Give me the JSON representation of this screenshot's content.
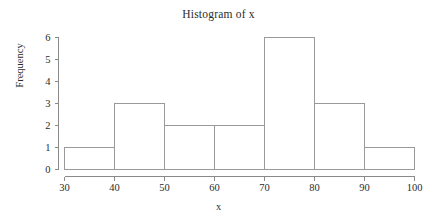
{
  "chart_data": {
    "type": "bar",
    "subtype": "histogram",
    "title": "Histogram of x",
    "xlabel": "x",
    "ylabel": "Frequency",
    "bin_edges": [
      30,
      40,
      50,
      60,
      70,
      80,
      90,
      100
    ],
    "categories": [
      "30-40",
      "40-50",
      "50-60",
      "60-70",
      "70-80",
      "80-90",
      "90-100"
    ],
    "values": [
      1,
      3,
      2,
      2,
      6,
      3,
      1
    ],
    "xlim": [
      30,
      100
    ],
    "ylim": [
      0,
      6
    ],
    "xticks": [
      30,
      40,
      50,
      60,
      70,
      80,
      90,
      100
    ],
    "yticks": [
      0,
      1,
      2,
      3,
      4,
      5,
      6
    ],
    "xtick_labels": [
      "30",
      "40",
      "50",
      "60",
      "70",
      "80",
      "90",
      "100"
    ],
    "ytick_labels": [
      "0",
      "1",
      "2",
      "3",
      "4",
      "5",
      "6"
    ],
    "grid": false,
    "legend": null,
    "bar_fill": "#ffffff",
    "bar_stroke": "#9a9a9a",
    "axis_color": "#8a8a8a",
    "text_color": "#2b2b2b",
    "background": "#ffffff",
    "total_count": 18
  }
}
